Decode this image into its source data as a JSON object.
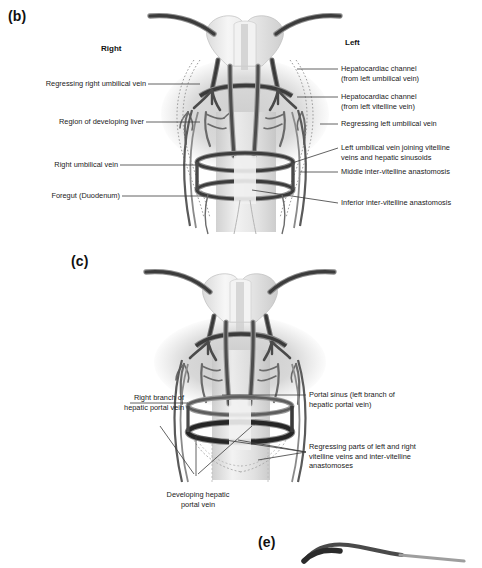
{
  "figure": {
    "panels": [
      {
        "tag": "(b)",
        "orientation_labels": {
          "right": "Right",
          "left": "Left"
        },
        "left_callouts": [
          {
            "name": "regressing-right-umbilical-vein",
            "text": "Regressing right umbilical vein"
          },
          {
            "name": "region-of-developing-liver",
            "text": "Region of developing liver"
          },
          {
            "name": "right-umbilical-vein",
            "text": "Right umbilical vein"
          },
          {
            "name": "foregut-duodenum",
            "text": "Foregut (Duodenum)"
          }
        ],
        "right_callouts": [
          {
            "name": "hepatocardiac-channel-umbilical",
            "text": "Hepatocardiac channel\n(from left umbilical vein)"
          },
          {
            "name": "hepatocardiac-channel-vitelline",
            "text": "Hepatocardiac channel\n(from left vitelline vein)"
          },
          {
            "name": "regressing-left-umbilical-vein",
            "text": "Regressing left umbilical  vein"
          },
          {
            "name": "left-umbilical-vein-joining",
            "text": "Left umbilical vein joining vitelline\nveins and hepatic sinusoids"
          },
          {
            "name": "middle-inter-vitelline-anastomosis",
            "text": "Middle inter-vitelline anastomosis"
          },
          {
            "name": "inferior-inter-vitelline-anastomosis",
            "text": "Inferior inter-vitelline anastomosis"
          }
        ]
      },
      {
        "tag": "(c)",
        "left_callouts": [
          {
            "name": "right-branch-hepatic-portal-vein",
            "text": "Right branch of\nhepatic portal vein"
          }
        ],
        "right_callouts": [
          {
            "name": "portal-sinus",
            "text": "Portal sinus (left branch of\nhepatic portal vein)"
          },
          {
            "name": "regressing-vitelline-parts",
            "text": "Regressing parts of left and right\nvitelline veins and inter-vitelline\nanastomoses"
          }
        ],
        "bottom_callouts": [
          {
            "name": "developing-hepatic-portal-vein",
            "text": "Developing hepatic\nportal vein"
          }
        ]
      },
      {
        "tag": "(e)",
        "left_callouts": [],
        "right_callouts": [],
        "bottom_callouts": []
      }
    ]
  },
  "colors": {
    "vessel_dark": "#3f3f3f",
    "vessel_mid": "#6e6e6e",
    "vessel_light": "#9a9a9a",
    "liver_fill": "#d6d6d6",
    "heart_fill": "#ededed",
    "gut_fill": "#e8e8e8",
    "leader_line": "#3a3a3a",
    "text": "#1a1a1a",
    "background": "#ffffff"
  }
}
